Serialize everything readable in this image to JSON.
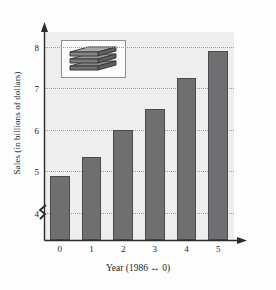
{
  "chart_data": {
    "type": "bar",
    "title": "",
    "subtitle": "",
    "xlabel": "Year (1986 ↔ 0)",
    "ylabel": "Sales (in billions of dollars)",
    "categories": [
      "0",
      "1",
      "2",
      "3",
      "4",
      "5"
    ],
    "values": [
      4.9,
      5.35,
      6.0,
      6.5,
      7.25,
      7.9
    ],
    "series": [
      {
        "name": "Sales",
        "values": [
          4.9,
          5.35,
          6.0,
          6.5,
          7.25,
          7.9
        ]
      }
    ],
    "ylim": [
      3.35,
      8.35
    ],
    "y_ticks": [
      4,
      5,
      6,
      7,
      8
    ],
    "y_tick_labels": [
      "4",
      "5",
      "6",
      "7",
      "8"
    ],
    "x_tick_labels": [
      "0",
      "1",
      "2",
      "3",
      "4",
      "5"
    ],
    "grid": true,
    "grid_axis": "y",
    "grid_style": "dotted",
    "y_axis_broken": true,
    "legend": false,
    "legend_position": "none",
    "axis_arrows": true,
    "colors": {
      "bar_fill": "#6f6e71",
      "bar_edge": "#4b4a4d",
      "plot_background": "#eeeeee",
      "gridline": "#9a9a9a",
      "axis": "#2b2b2b",
      "text": "#1e1e1e",
      "figure_background": "#fdfdfd"
    },
    "annotations": [
      {
        "name": "product-stack-icon",
        "type": "inset-image",
        "description": "stack-of-boxes-icon",
        "position": "upper-left inside plot area"
      }
    ]
  }
}
